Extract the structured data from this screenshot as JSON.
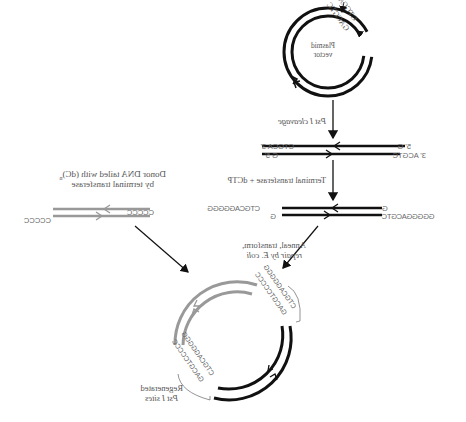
{
  "diagram": {
    "mirrored": true,
    "plasmid": {
      "label_line1": "Plasmid",
      "label_line2": "vector",
      "site_top": "CTGCAG",
      "site_bottom": "GACGTC"
    },
    "steps": {
      "cleavage": "Pst I cleavage",
      "tailing": "Terminal transferase + dCTP",
      "anneal_line1": "Anneal, transform,",
      "anneal_line2": "repair by E. coli"
    },
    "cut_ends": {
      "left_top": "CTGCA 3'",
      "left_bottom": "G 5'",
      "right_top": "5' G",
      "right_bottom": "3' ACGTC"
    },
    "tailed_ends": {
      "left_top": "CTGCAGGGGG",
      "left_bottom": "G",
      "right_top": "G",
      "right_bottom": "GGGGGACGTC"
    },
    "donor": {
      "label_line1": "Donor DNA tailed with (dC)",
      "label_sub": "n",
      "label_line2": "by terminal transferase",
      "left_tail": "CCCCC",
      "right_tail": "CCCCC"
    },
    "product": {
      "site_a_top": "CTGCAGGGGG",
      "site_a_bottom": "GACGTCCCCC",
      "site_b_top": "CTGCAGGGGG",
      "site_b_bottom": "GACGTCCCCC",
      "regenerated_line1": "Regenerated",
      "regenerated_line2": "Pst I sites"
    },
    "colors": {
      "vector": "#111111",
      "donor": "#999999",
      "text": "#555555"
    }
  }
}
